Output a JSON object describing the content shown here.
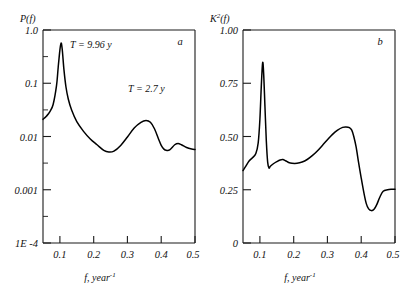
{
  "figure": {
    "panels": [
      {
        "letter": "a",
        "ylabel": "P(f)",
        "xlabel": "f, year",
        "xlabel_sup": "-1",
        "yticks": [
          "1.0",
          "0.1",
          "0.01",
          "0.001",
          "1E -4"
        ],
        "xticks": [
          "0.1",
          "0.2",
          "0.3",
          "0.4",
          "0.5"
        ],
        "annotations": [
          "T = 9.96 y",
          "T = 2.7 y"
        ]
      },
      {
        "letter": "b",
        "ylabel": "K",
        "ylabel_sup": "2",
        "ylabel_tail": "(f)",
        "xlabel": "f, year",
        "xlabel_sup": "-1",
        "yticks": [
          "1.00",
          "0.75",
          "0.50",
          "0.25",
          "0"
        ],
        "xticks": [
          "0.1",
          "0.2",
          "0.3",
          "0.4",
          "0.5"
        ],
        "annotations": []
      }
    ]
  },
  "chart_data": [
    {
      "type": "line",
      "title": "",
      "panel": "a",
      "xlabel": "f, year^-1",
      "ylabel": "P(f)",
      "yscale": "log",
      "xlim": [
        0.05,
        0.5
      ],
      "ylim": [
        0.0001,
        1.0
      ],
      "yticks": [
        1.0,
        0.1,
        0.01,
        0.001,
        0.0001
      ],
      "ytick_labels": [
        "1.0",
        "0.1",
        "0.01",
        "0.001",
        "1E -4"
      ],
      "xticks": [
        0.1,
        0.2,
        0.3,
        0.4,
        0.5
      ],
      "grid": false,
      "legend": null,
      "annotations": [
        {
          "text": "T = 9.96 y",
          "x": 0.135,
          "y": 0.62
        },
        {
          "text": "T = 2.7 y",
          "x": 0.325,
          "y": 0.075
        }
      ],
      "x": [
        0.05,
        0.06,
        0.07,
        0.08,
        0.09,
        0.095,
        0.1,
        0.1035,
        0.107,
        0.112,
        0.118,
        0.125,
        0.135,
        0.15,
        0.17,
        0.19,
        0.21,
        0.23,
        0.245,
        0.26,
        0.28,
        0.3,
        0.32,
        0.34,
        0.355,
        0.368,
        0.38,
        0.392,
        0.4,
        0.408,
        0.415,
        0.425,
        0.44,
        0.45,
        0.46,
        0.475,
        0.49,
        0.5
      ],
      "y": [
        0.021,
        0.024,
        0.029,
        0.04,
        0.09,
        0.2,
        0.42,
        0.57,
        0.43,
        0.18,
        0.085,
        0.05,
        0.031,
        0.019,
        0.0125,
        0.009,
        0.007,
        0.0055,
        0.0051,
        0.0053,
        0.0068,
        0.0098,
        0.0145,
        0.0185,
        0.02,
        0.0185,
        0.014,
        0.009,
        0.0068,
        0.0058,
        0.0055,
        0.0056,
        0.007,
        0.0074,
        0.007,
        0.0062,
        0.0058,
        0.0057
      ]
    },
    {
      "type": "line",
      "title": "",
      "panel": "b",
      "xlabel": "f, year^-1",
      "ylabel": "K^2(f)",
      "yscale": "linear",
      "xlim": [
        0.05,
        0.5
      ],
      "ylim": [
        0,
        1.0
      ],
      "yticks": [
        0,
        0.25,
        0.5,
        0.75,
        1.0
      ],
      "ytick_labels": [
        "0",
        "0.25",
        "0.50",
        "0.75",
        "1.00"
      ],
      "xticks": [
        0.1,
        0.2,
        0.3,
        0.4,
        0.5
      ],
      "grid": false,
      "legend": null,
      "annotations": [],
      "x": [
        0.05,
        0.058,
        0.068,
        0.078,
        0.088,
        0.095,
        0.1,
        0.104,
        0.108,
        0.111,
        0.115,
        0.119,
        0.123,
        0.127,
        0.131,
        0.14,
        0.15,
        0.16,
        0.168,
        0.176,
        0.185,
        0.195,
        0.21,
        0.225,
        0.24,
        0.255,
        0.27,
        0.285,
        0.3,
        0.315,
        0.33,
        0.345,
        0.355,
        0.365,
        0.372,
        0.378,
        0.385,
        0.392,
        0.4,
        0.408,
        0.415,
        0.422,
        0.43,
        0.438,
        0.446,
        0.455,
        0.465,
        0.478,
        0.49,
        0.5
      ],
      "y": [
        0.34,
        0.36,
        0.385,
        0.4,
        0.42,
        0.47,
        0.58,
        0.73,
        0.845,
        0.8,
        0.64,
        0.48,
        0.38,
        0.352,
        0.36,
        0.372,
        0.382,
        0.39,
        0.392,
        0.386,
        0.378,
        0.374,
        0.374,
        0.38,
        0.392,
        0.41,
        0.432,
        0.458,
        0.485,
        0.51,
        0.53,
        0.543,
        0.545,
        0.542,
        0.53,
        0.5,
        0.45,
        0.38,
        0.305,
        0.235,
        0.185,
        0.16,
        0.152,
        0.158,
        0.18,
        0.215,
        0.243,
        0.25,
        0.252,
        0.252
      ]
    }
  ]
}
